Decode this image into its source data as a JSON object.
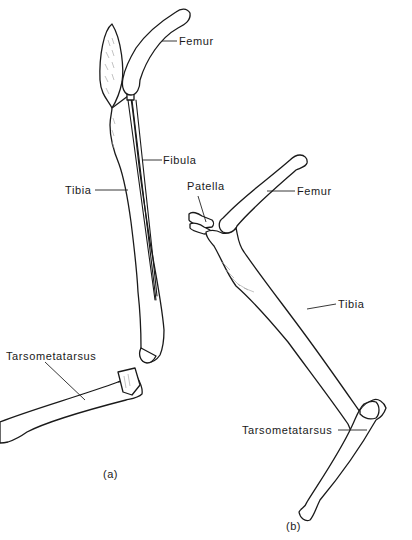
{
  "figure": {
    "panels": [
      {
        "id": "a",
        "caption": "(a)",
        "labels": {
          "femur": "Femur",
          "fibula": "Fibula",
          "tibia": "Tibia",
          "tarsometatarsus": "Tarsometatarsus"
        }
      },
      {
        "id": "b",
        "caption": "(b)",
        "labels": {
          "patella": "Patella",
          "femur": "Femur",
          "tibia": "Tibia",
          "tarsometatarsus": "Tarsometatarsus"
        }
      }
    ],
    "colors": {
      "line": "#1a1a1a",
      "background": "#ffffff",
      "shading": "#9a9a9a"
    }
  }
}
